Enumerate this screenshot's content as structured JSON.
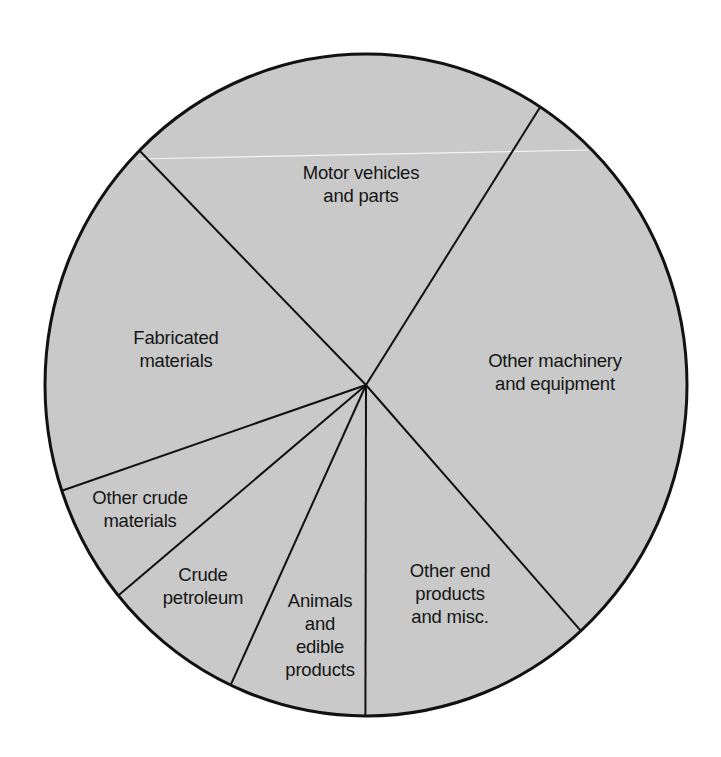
{
  "chart_data": {
    "type": "pie",
    "title": "",
    "start_angle_deg": 315.1,
    "direction": "clockwise",
    "slices": [
      {
        "label": "Motor vehicles and parts",
        "percent": 21.6
      },
      {
        "label": "Other machinery and equipment",
        "percent": 29.2
      },
      {
        "label": "Other end products and misc.",
        "percent": 11.7
      },
      {
        "label": "Animals and edible products",
        "percent": 6.9
      },
      {
        "label": "Crude petroleum",
        "percent": 7.1
      },
      {
        "label": "Other crude materials",
        "percent": 5.8
      },
      {
        "label": "Fabricated materials",
        "percent": 17.7
      }
    ],
    "legend": "none (labels inside slices)",
    "colors": {
      "fill": "#c9c9c9",
      "outline": "#111111",
      "background": "#ffffff"
    }
  },
  "labels": {
    "motor_vehicles": "Motor vehicles\nand parts",
    "other_machinery": "Other machinery\nand equipment",
    "other_end_products": "Other end\nproducts\nand misc.",
    "animals": "Animals\nand\nedible\nproducts",
    "crude_petroleum": "Crude\npetroleum",
    "other_crude": "Other crude\nmaterials",
    "fabricated": "Fabricated\nmaterials"
  }
}
